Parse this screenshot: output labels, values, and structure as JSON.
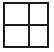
{
  "icon": {
    "name": "grid-2x2-icon",
    "label": "Grid",
    "description": "Two by two grid of empty panes",
    "rows": 2,
    "columns": 2,
    "pane_count": 4,
    "colors": {
      "background": "#ffffff",
      "stroke": "#1c1c1c",
      "pane_fill": "#ffffff"
    },
    "geometry": {
      "canvas_width": 54,
      "canvas_height": 52,
      "frame_left": 3,
      "frame_top": 2,
      "frame_width": 46,
      "frame_height": 46,
      "border_width": 2,
      "divider_width": 2,
      "divider_vertical_x": 26,
      "divider_horizontal_y": 24
    },
    "panes": [
      {
        "id": "top-left",
        "row": 1,
        "column": 1,
        "content": ""
      },
      {
        "id": "top-right",
        "row": 1,
        "column": 2,
        "content": ""
      },
      {
        "id": "bottom-left",
        "row": 2,
        "column": 1,
        "content": ""
      },
      {
        "id": "bottom-right",
        "row": 2,
        "column": 2,
        "content": ""
      }
    ]
  }
}
